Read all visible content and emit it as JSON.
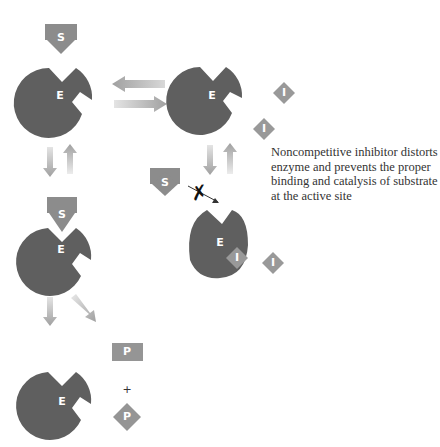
{
  "labels": {
    "enzyme": "E",
    "substrate": "S",
    "inhibitor": "I",
    "product": "P",
    "plus": "+"
  },
  "caption": "Noncompetitive inhibitor distorts enzyme and prevents the proper binding and catalysis of substrate at the active site",
  "colors": {
    "enzyme": "#5f5f5f",
    "substrate": "#8c8c8c",
    "inhibitor": "#999999",
    "product": "#959595",
    "arrow": "#a8a8a8",
    "label": "#ffffff"
  },
  "states": [
    {
      "id": "free-enzyme-substrate",
      "enzyme": "E",
      "substrate": "S"
    },
    {
      "id": "free-enzyme-inhibitor",
      "enzyme": "E",
      "inhibitor": "I"
    },
    {
      "id": "enzyme-substrate-complex",
      "enzyme": "E",
      "substrate": "S"
    },
    {
      "id": "enzyme-inhibitor-complex",
      "enzyme": "E",
      "inhibitor": "I",
      "blocked_substrate": "S"
    },
    {
      "id": "enzyme-products",
      "enzyme": "E",
      "products": [
        "P",
        "P"
      ]
    }
  ]
}
